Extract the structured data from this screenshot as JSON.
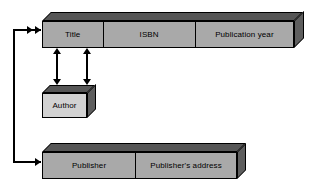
{
  "diagram": {
    "background_color": "#ffffff",
    "colors": {
      "front_face": "#a9a9a9",
      "front_face_light": "#d2d2d2",
      "top_face": "#565656",
      "side_face": "#5e5e5e",
      "stroke": "#000000"
    },
    "entities": [
      {
        "id": "book",
        "name": "book-table",
        "fields": [
          {
            "label": "Title"
          },
          {
            "label": "ISBN"
          },
          {
            "label": "Publication year"
          }
        ]
      },
      {
        "id": "author",
        "name": "author-table",
        "fields": [
          {
            "label": "Author"
          }
        ]
      },
      {
        "id": "publisher",
        "name": "publisher-table",
        "fields": [
          {
            "label": "Publisher"
          },
          {
            "label": "Publisher's address"
          }
        ]
      }
    ],
    "connectors": [
      {
        "id": "title-author-1",
        "name": "title-to-author-link-left",
        "kind": "double-headed-vertical"
      },
      {
        "id": "title-author-2",
        "name": "title-to-author-link-right",
        "kind": "double-headed-vertical"
      },
      {
        "id": "book-publisher",
        "name": "book-to-publisher-link",
        "kind": "routed-elbow-right-arrow"
      }
    ]
  }
}
